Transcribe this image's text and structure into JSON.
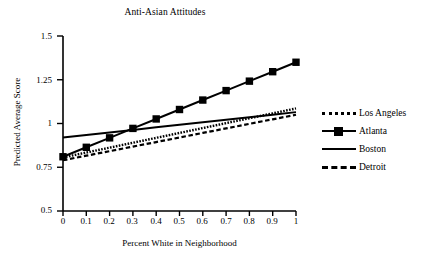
{
  "chart_data": {
    "type": "line",
    "title": "Anti-Asian Attitudes",
    "xlabel": "Percent White in Neighborhood",
    "ylabel": "Predicted Average Score",
    "xlim": [
      0,
      1
    ],
    "ylim": [
      0.5,
      1.5
    ],
    "grid": false,
    "legend_position": "right",
    "xticks": [
      "0",
      "0.1",
      "0.2",
      "0.3",
      "0.4",
      "0.5",
      "0.6",
      "0.7",
      "0.8",
      "0.9",
      "1"
    ],
    "xtick_values": [
      0,
      0.1,
      0.2,
      0.3,
      0.4,
      0.5,
      0.6,
      0.7,
      0.8,
      0.9,
      1
    ],
    "yticks": [
      "0.5",
      "0.75",
      "1",
      "1.25",
      "1.5"
    ],
    "ytick_values": [
      0.5,
      0.75,
      1,
      1.25,
      1.5
    ],
    "x": [
      0,
      0.1,
      0.2,
      0.3,
      0.4,
      0.5,
      0.6,
      0.7,
      0.8,
      0.9,
      1
    ],
    "series": [
      {
        "name": "Los Angeles",
        "style": "dotted",
        "marker": "none",
        "color": "#000000",
        "values": [
          0.806,
          0.834,
          0.862,
          0.89,
          0.918,
          0.946,
          0.974,
          1.002,
          1.03,
          1.058,
          1.086
        ]
      },
      {
        "name": "Atlanta",
        "style": "solid",
        "marker": "square",
        "color": "#000000",
        "values": [
          0.81,
          0.864,
          0.918,
          0.972,
          1.026,
          1.08,
          1.134,
          1.188,
          1.242,
          1.296,
          1.35
        ]
      },
      {
        "name": "Boston",
        "style": "solid",
        "marker": "none",
        "color": "#000000",
        "values": [
          0.92,
          0.9345,
          0.949,
          0.9635,
          0.978,
          0.9925,
          1.007,
          1.0215,
          1.036,
          1.0505,
          1.065
        ]
      },
      {
        "name": "Detroit",
        "style": "dashed",
        "marker": "none",
        "color": "#000000",
        "values": [
          0.79,
          0.816,
          0.842,
          0.868,
          0.894,
          0.92,
          0.946,
          0.972,
          0.998,
          1.024,
          1.05
        ]
      }
    ]
  },
  "legend": {
    "items": [
      {
        "label": "Los Angeles",
        "key": "dotted-line-key"
      },
      {
        "label": "Atlanta",
        "key": "solid-line-square-marker-key"
      },
      {
        "label": "Boston",
        "key": "solid-line-key"
      },
      {
        "label": "Detroit",
        "key": "dashed-line-key"
      }
    ]
  },
  "colors": {
    "foreground": "#000000",
    "background": "#ffffff"
  }
}
